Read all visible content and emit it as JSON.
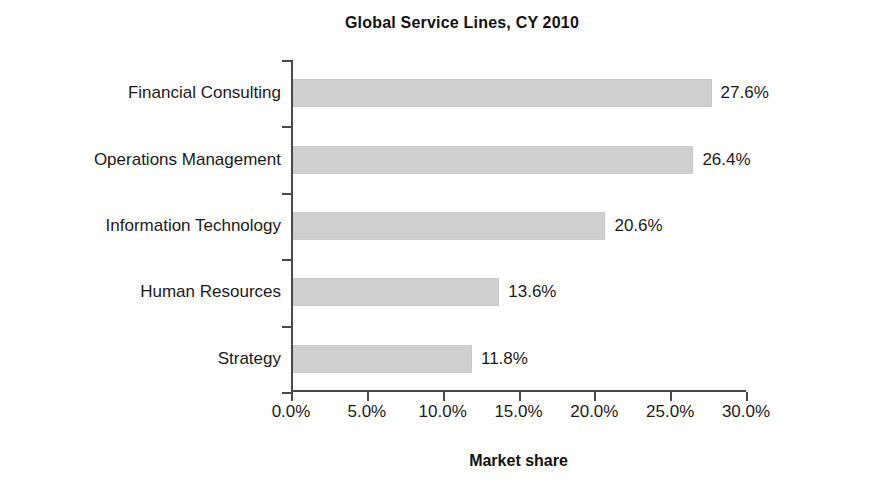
{
  "chart_data": {
    "type": "bar",
    "orientation": "horizontal",
    "title": "Global Service Lines, CY 2010",
    "xlabel": "Market share",
    "ylabel": "",
    "categories": [
      "Financial Consulting",
      "Operations Management",
      "Information Technology",
      "Human Resources",
      "Strategy"
    ],
    "values": [
      27.6,
      26.4,
      20.6,
      13.6,
      11.8
    ],
    "value_labels": [
      "27.6%",
      "26.4%",
      "20.6%",
      "13.6%",
      "11.8%"
    ],
    "xlim": [
      0,
      30
    ],
    "xticks": [
      0,
      5,
      10,
      15,
      20,
      25,
      30
    ],
    "xtick_labels": [
      "0.0%",
      "5.0%",
      "10.0%",
      "15.0%",
      "20.0%",
      "25.0%",
      "30.0%"
    ],
    "grid": false,
    "legend": null,
    "units": "percent",
    "bar_color": "#cfcfcf",
    "axis_color": "#4a4a4a",
    "text_color": "#1a1a1a",
    "background_color": "#ffffff"
  }
}
